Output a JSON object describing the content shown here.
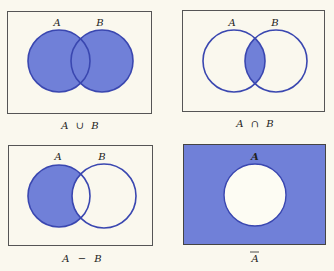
{
  "colors": {
    "background": "#faf8ee",
    "fill": "#7080d8",
    "stroke": "#3a47b0",
    "frame": "#555555",
    "hole": "#fdfcf3"
  },
  "panels": [
    {
      "id": "union",
      "caption": {
        "left": "A",
        "op": "∪",
        "right": "B"
      },
      "set_labels": [
        "A",
        "B"
      ],
      "shaded_region": "A ∪ B"
    },
    {
      "id": "intersection",
      "caption": {
        "left": "A",
        "op": "∩",
        "right": "B"
      },
      "set_labels": [
        "A",
        "B"
      ],
      "shaded_region": "A ∩ B"
    },
    {
      "id": "difference",
      "caption": {
        "left": "A",
        "op": "−",
        "right": "B"
      },
      "set_labels": [
        "A",
        "B"
      ],
      "shaded_region": "A − B"
    },
    {
      "id": "complement",
      "caption": {
        "left": "A",
        "op": "",
        "right": ""
      },
      "set_labels": [
        "A"
      ],
      "shaded_region": "complement of A (Ā)"
    }
  ]
}
